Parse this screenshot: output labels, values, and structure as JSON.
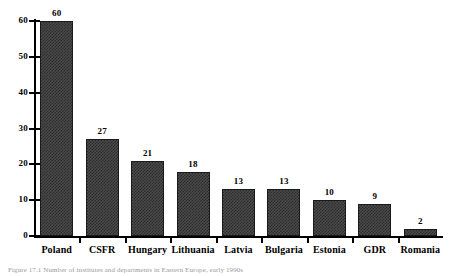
{
  "chart_data": {
    "type": "bar",
    "title": "",
    "subtitle": "",
    "xlabel": "",
    "ylabel": "",
    "categories": [
      "Poland",
      "CSFR",
      "Hungary",
      "Lithuania",
      "Latvia",
      "Bulgaria",
      "Estonia",
      "GDR",
      "Romania"
    ],
    "values": [
      60,
      27,
      21,
      18,
      13,
      13,
      10,
      9,
      2
    ],
    "data_labels": [
      "60",
      "27",
      "21",
      "18",
      "13",
      "13",
      "10",
      "9",
      "2"
    ],
    "ylim": [
      0,
      60
    ],
    "ytick_labels": [
      "0",
      "10",
      "20",
      "30",
      "40",
      "50",
      "60"
    ],
    "ytick_values": [
      0,
      10,
      20,
      30,
      40,
      50,
      60
    ],
    "grid": false,
    "legend": "none",
    "bar_fill": "#3c3c3c",
    "bar_pattern": "checkerboard-hatch",
    "bar_edge_color": "#1a1a1a",
    "axis_color": "#000000",
    "background_color": "#ffffff",
    "text_color": "#000000"
  },
  "caption": {
    "text": "Figure 17.1  Number of institutes and departments in Eastern Europe, early 1990s",
    "color": "#9a9a9a"
  }
}
